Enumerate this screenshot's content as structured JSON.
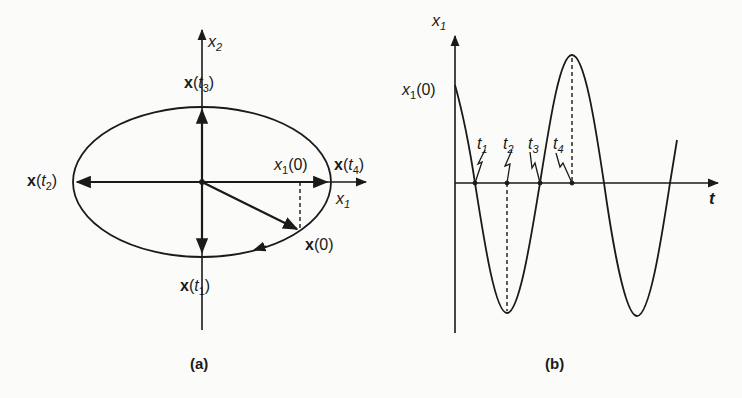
{
  "figure": {
    "panel_a": {
      "caption": "(a)",
      "axis_x2": {
        "var": "x",
        "sub": "2"
      },
      "axis_x1": {
        "var": "x",
        "sub": "1"
      },
      "labels": {
        "x_t3": {
          "bold": "x",
          "open": "(",
          "var": "t",
          "sub": "3",
          "close": ")"
        },
        "x_t2": {
          "bold": "x",
          "open": "(",
          "var": "t",
          "sub": "2",
          "close": ")"
        },
        "x_t4": {
          "bold": "x",
          "open": "(",
          "var": "t",
          "sub": "4",
          "close": ")"
        },
        "x_t1": {
          "bold": "x",
          "open": "(",
          "var": "t",
          "sub": "1",
          "close": ")"
        },
        "x_0": {
          "bold": "x",
          "rest": "(0)"
        },
        "x1_0": {
          "var": "x",
          "sub": "1",
          "rest": "(0)"
        }
      }
    },
    "panel_b": {
      "caption": "(b)",
      "axis_y": {
        "var": "x",
        "sub": "1"
      },
      "axis_t": {
        "var": "t"
      },
      "x1_0": {
        "var": "x",
        "sub": "1",
        "rest": "(0)"
      },
      "time_marks": [
        {
          "var": "t",
          "sub": "1"
        },
        {
          "var": "t",
          "sub": "2"
        },
        {
          "var": "t",
          "sub": "3"
        },
        {
          "var": "t",
          "sub": "4"
        }
      ]
    },
    "colors": {
      "ink": "#1a1a1a",
      "paper": "#fbfbf9"
    }
  }
}
